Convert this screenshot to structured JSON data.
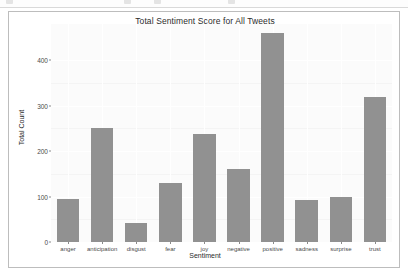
{
  "app_chrome": {
    "visible": true
  },
  "figure": {
    "title": "Total Sentiment Score for All Tweets",
    "panel_background": "#fbfbfb",
    "bar_color": "#919191",
    "grid_color": "#ffffff",
    "border_color": "#bdbdbd"
  },
  "chart_data": {
    "type": "bar",
    "title": "Total Sentiment Score for All Tweets",
    "xlabel": "Sentiment",
    "ylabel": "Total Count",
    "categories": [
      "anger",
      "anticipation",
      "disgust",
      "fear",
      "joy",
      "negative",
      "positive",
      "sadness",
      "surprise",
      "trust"
    ],
    "values": [
      95,
      250,
      42,
      130,
      237,
      160,
      461,
      92,
      100,
      320
    ],
    "ylim": [
      0,
      480
    ],
    "yticks": [
      0,
      100,
      200,
      300,
      400
    ],
    "ytick_labels": [
      "0",
      "100",
      "200",
      "300",
      "400"
    ],
    "grid": true,
    "legend": "none",
    "orientation": "vertical"
  }
}
